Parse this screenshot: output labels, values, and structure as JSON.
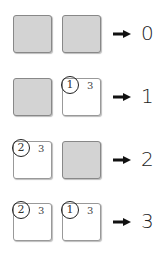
{
  "rows": [
    {
      "boxes": [
        {
          "type": "grey"
        },
        {
          "type": "grey"
        }
      ],
      "result": "0"
    },
    {
      "boxes": [
        {
          "type": "grey"
        },
        {
          "type": "white",
          "circled": "1",
          "value": "3"
        }
      ],
      "result": "1"
    },
    {
      "boxes": [
        {
          "type": "white",
          "circled": "2",
          "value": "3"
        },
        {
          "type": "grey"
        }
      ],
      "result": "2"
    },
    {
      "boxes": [
        {
          "type": "white",
          "circled": "2",
          "value": "3"
        },
        {
          "type": "white",
          "circled": "1",
          "value": "3"
        }
      ],
      "result": "3"
    }
  ],
  "arrow_icon": "right-arrow-icon"
}
